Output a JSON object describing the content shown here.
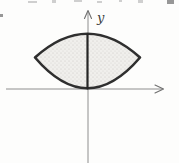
{
  "figure": {
    "type": "math-diagram",
    "labels": {
      "y_axis": "y"
    },
    "colors": {
      "background": "#fdfdfc",
      "axis": "#8e8e8e",
      "curve_outline": "#2f2f2f",
      "region_fill": "#f0efec",
      "stipple_dot": "#c8c6c2",
      "label_text": "#3c3c3c"
    },
    "svg": {
      "lens_path": "M 35 57.5 Q 87.5 10 140 57.5 Q 87.5 119 35 57.5 Z"
    },
    "geometry": {
      "canvas": {
        "width": 179,
        "height": 163
      },
      "origin": {
        "x": 88,
        "y": 89
      },
      "lens_left_tip": {
        "x": 35,
        "y": 57.5
      },
      "lens_right_tip": {
        "x": 140,
        "y": 57.5
      },
      "lens_top": {
        "x": 87.5,
        "y": 34
      },
      "lens_bottom_tangent_point": {
        "x": 87.5,
        "y": 88.5
      },
      "bold_chord": {
        "x": 87.5,
        "y_from": 34.5,
        "y_to": 88.5
      }
    }
  }
}
